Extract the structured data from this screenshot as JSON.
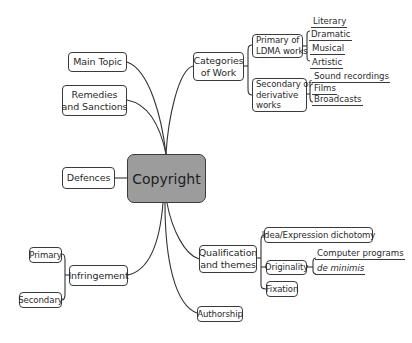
{
  "diagram": {
    "type": "mind-map",
    "central": {
      "label": "Copyright",
      "fill": "#9c9c9c"
    },
    "branches": {
      "main_topic": {
        "label": "Main Topic"
      },
      "remedies": {
        "label_line1": "Remedies",
        "label_line2": "and Sanctions"
      },
      "defences": {
        "label": "Defences"
      },
      "infringement": {
        "label": "Infringement",
        "children": [
          {
            "label": "Primary"
          },
          {
            "label": "Secondary"
          }
        ]
      },
      "categories": {
        "label_line1": "Categories",
        "label_line2": "of Work",
        "primary": {
          "label_line1": "Primary of",
          "label_line2": "LDMA works",
          "leaves": [
            "Literary",
            "Dramatic",
            "Musical",
            "Artistic"
          ]
        },
        "secondary": {
          "label_line1": "Secondary of",
          "label_line2": "derivative",
          "label_line3": "works",
          "leaves": [
            "Sound recordings",
            "Films",
            "Broadcasts"
          ]
        }
      },
      "qualification": {
        "label_line1": "Qualification",
        "label_line2": "and themes",
        "children": {
          "idea": {
            "label": "Idea/Expression dichotomy"
          },
          "originality": {
            "label": "Originality",
            "leaves": [
              "Computer programs",
              "de minimis"
            ]
          },
          "fixation": {
            "label": "Fixation"
          }
        }
      },
      "authorship": {
        "label": "Authorship"
      }
    }
  }
}
